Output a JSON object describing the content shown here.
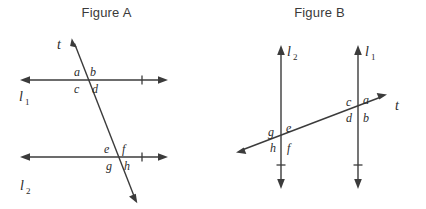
{
  "figures": [
    {
      "title": "Figure A",
      "lines": [
        {
          "name": "l1",
          "label": "l",
          "subscript": "1"
        },
        {
          "name": "l2",
          "label": "l",
          "subscript": "2"
        },
        {
          "name": "t",
          "label": "t",
          "subscript": ""
        }
      ],
      "angles": [
        {
          "id": "a",
          "label": "a",
          "position": "upper-left-at-l1"
        },
        {
          "id": "b",
          "label": "b",
          "position": "upper-right-at-l1"
        },
        {
          "id": "c",
          "label": "c",
          "position": "lower-left-at-l1"
        },
        {
          "id": "d",
          "label": "d",
          "position": "lower-right-at-l1"
        },
        {
          "id": "e",
          "label": "e",
          "position": "upper-left-at-l2"
        },
        {
          "id": "f",
          "label": "f",
          "position": "upper-right-at-l2"
        },
        {
          "id": "g",
          "label": "g",
          "position": "lower-left-at-l2"
        },
        {
          "id": "h",
          "label": "h",
          "position": "lower-right-at-l2"
        }
      ]
    },
    {
      "title": "Figure B",
      "lines": [
        {
          "name": "l2",
          "label": "l",
          "subscript": "2"
        },
        {
          "name": "l1",
          "label": "l",
          "subscript": "1"
        },
        {
          "name": "t",
          "label": "t",
          "subscript": ""
        }
      ],
      "angles": [
        {
          "id": "c",
          "label": "c",
          "position": "upper-left-at-l1"
        },
        {
          "id": "a",
          "label": "a",
          "position": "upper-right-at-l1"
        },
        {
          "id": "d",
          "label": "d",
          "position": "lower-left-at-l1"
        },
        {
          "id": "b",
          "label": "b",
          "position": "lower-right-at-l1"
        },
        {
          "id": "g",
          "label": "g",
          "position": "upper-left-at-l2"
        },
        {
          "id": "e",
          "label": "e",
          "position": "upper-right-at-l2"
        },
        {
          "id": "h",
          "label": "h",
          "position": "lower-left-at-l2"
        },
        {
          "id": "f",
          "label": "f",
          "position": "lower-right-at-l2"
        }
      ]
    }
  ],
  "colors": {
    "stroke": "#3b3b3b",
    "text": "#2b2b2b",
    "title": "#3a3a3a",
    "background": "#ffffff"
  }
}
